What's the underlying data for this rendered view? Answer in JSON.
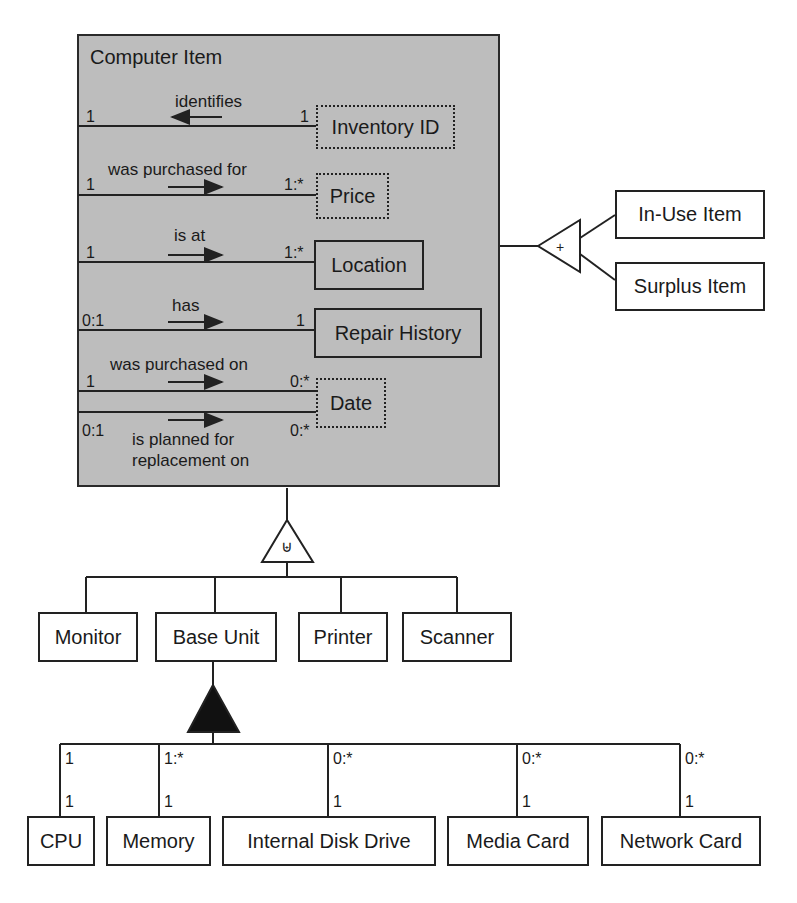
{
  "parent": {
    "title": "Computer Item",
    "relationships": [
      {
        "label": "identifies",
        "from_mult": "1",
        "to_mult": "1",
        "target": "Inventory ID",
        "arrow": "left",
        "target_style": "dotted"
      },
      {
        "label": "was purchased for",
        "from_mult": "1",
        "to_mult": "1:*",
        "target": "Price",
        "arrow": "right",
        "target_style": "dotted"
      },
      {
        "label": "is at",
        "from_mult": "1",
        "to_mult": "1:*",
        "target": "Location",
        "arrow": "right",
        "target_style": "solid"
      },
      {
        "label": "has",
        "from_mult": "0:1",
        "to_mult": "1",
        "target": "Repair History",
        "arrow": "right",
        "target_style": "solid"
      },
      {
        "label": "was purchased on",
        "from_mult": "1",
        "to_mult": "0:*",
        "target": "Date",
        "arrow": "right",
        "target_style": "dotted"
      },
      {
        "label": "is planned for replacement on",
        "label_line1": "is planned for",
        "label_line2": "replacement on",
        "from_mult": "0:1",
        "to_mult": "0:*",
        "target": "Date",
        "arrow": "right",
        "target_style": "dotted"
      }
    ]
  },
  "status_subtypes": {
    "symbol": "+",
    "items": [
      "In-Use Item",
      "Surplus Item"
    ]
  },
  "type_subtypes": {
    "symbol": "⊎",
    "items": [
      "Monitor",
      "Base Unit",
      "Printer",
      "Scanner"
    ]
  },
  "base_unit_aggregation": {
    "parts": [
      {
        "name": "CPU",
        "whole_mult": "1",
        "part_mult": "1"
      },
      {
        "name": "Memory",
        "whole_mult": "1:*",
        "part_mult": "1"
      },
      {
        "name": "Internal Disk Drive",
        "whole_mult": "0:*",
        "part_mult": "1"
      },
      {
        "name": "Media Card",
        "whole_mult": "0:*",
        "part_mult": "1"
      },
      {
        "name": "Network Card",
        "whole_mult": "0:*",
        "part_mult": "1"
      }
    ]
  }
}
